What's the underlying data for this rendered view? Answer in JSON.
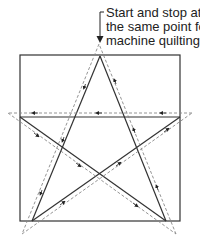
{
  "diagram": {
    "annotation": {
      "lines": [
        "Start and stop at",
        "the same point for",
        "machine quilting"
      ]
    },
    "colors": {
      "solid_line": "#333333",
      "dashed_line": "#888888",
      "square": "#333333",
      "arrow": "#222222"
    },
    "square": {
      "x": 20,
      "y": 55,
      "width": 160,
      "height": 166
    },
    "star_vertices": {
      "top": [
        100,
        56
      ],
      "bottom_left": [
        32,
        221
      ],
      "right": [
        180,
        117
      ],
      "left": [
        20,
        117
      ],
      "bottom_right": [
        166,
        221
      ]
    },
    "stitch_path_order": [
      "top",
      "bottom_left",
      "right",
      "left",
      "bottom_right",
      "top"
    ]
  }
}
